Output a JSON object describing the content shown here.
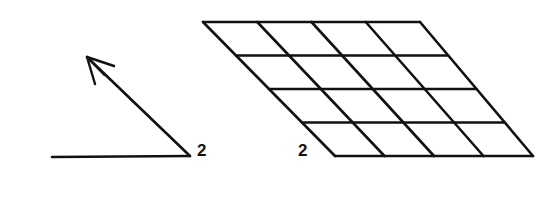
{
  "figure": {
    "background_color": "#ffffff",
    "ink_color": "#111111",
    "width": 550,
    "height": 197,
    "stroke_width": 2.6
  },
  "vector_panel": {
    "name": "vector-with-baseline",
    "label": "2",
    "label_position": {
      "x": 197,
      "y": 142
    },
    "baseline": {
      "x1": 52,
      "y1": 157,
      "x2": 190,
      "y2": 156
    },
    "arrow_shaft": {
      "x1": 190,
      "y1": 156,
      "x2": 89,
      "y2": 59
    },
    "arrow_head": {
      "tip": {
        "x": 87,
        "y": 57
      },
      "barb_left": {
        "x": 95,
        "y": 84
      },
      "barb_right": {
        "x": 114,
        "y": 66
      }
    }
  },
  "grid_panel": {
    "name": "sheared-grid",
    "label": "2",
    "label_position": {
      "x": 298,
      "y": 142
    },
    "rows": 4,
    "columns": 4,
    "corners": {
      "top_left": {
        "x": 203,
        "y": 22
      },
      "top_right": {
        "x": 420,
        "y": 22
      },
      "bottom_right": {
        "x": 533,
        "y": 156
      },
      "bottom_left": {
        "x": 335,
        "y": 156
      }
    }
  }
}
